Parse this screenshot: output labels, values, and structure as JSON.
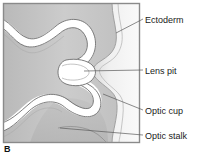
{
  "figure": {
    "panel_letter": "B",
    "background_color": "#ffffff",
    "frame": {
      "x": 3,
      "y": 3,
      "width": 137,
      "height": 140,
      "border_color": "#8a8a8a",
      "fill_color": "#c9c9c9"
    }
  },
  "labels": [
    {
      "id": "ectoderm",
      "text": "Ectoderm",
      "x": 145,
      "y": 15,
      "leader_from": [
        143,
        19
      ],
      "leader_to": [
        116,
        32
      ]
    },
    {
      "id": "lens-pit",
      "text": "Lens pit",
      "x": 145,
      "y": 66,
      "leader_from": [
        143,
        70
      ],
      "leader_to": [
        84,
        71
      ]
    },
    {
      "id": "optic-cup",
      "text": "Optic cup",
      "x": 145,
      "y": 106,
      "leader_from": [
        143,
        110
      ],
      "leader_to": [
        103,
        94
      ]
    },
    {
      "id": "optic-stalk",
      "text": "Optic stalk",
      "x": 145,
      "y": 131,
      "leader_from": [
        143,
        135
      ],
      "leader_to": [
        60,
        128
      ]
    }
  ],
  "structures": {
    "ectoderm_band": {
      "name": "Ectoderm",
      "fill": "#f2f2f2",
      "outline": "#9a9a9a"
    },
    "optic_vesicle_wall": {
      "name": "Optic cup neuroepithelium",
      "fill": "#ffffff",
      "outline": "#6e6e6e"
    },
    "lens_pit": {
      "name": "Lens pit",
      "fill": "#ffffff"
    },
    "optic_stalk": {
      "name": "Optic stalk",
      "fill": "#bdbdbd"
    },
    "mesenchyme": {
      "name": "Surrounding mesenchyme",
      "fill": "#c4c4c4"
    }
  },
  "colors": {
    "outline": "#6e6e6e",
    "frame_border": "#8a8a8a",
    "text": "#1a1a1a",
    "leader_line": "#5a5a5a",
    "light_fill": "#f2f2f2",
    "mid_fill": "#c4c4c4",
    "white_fill": "#ffffff"
  }
}
